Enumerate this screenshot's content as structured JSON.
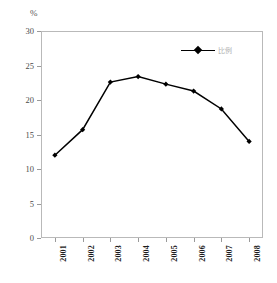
{
  "chart_data": {
    "type": "line",
    "title": "",
    "xlabel": "",
    "ylabel": "%",
    "unit_symbol": "%",
    "categories": [
      "2001",
      "2002",
      "2003",
      "2004",
      "2005",
      "2006",
      "2007",
      "2008"
    ],
    "series": [
      {
        "name": "比例",
        "values": [
          12.0,
          15.7,
          22.6,
          23.4,
          22.3,
          21.3,
          18.7,
          14.0
        ]
      }
    ],
    "ylim": [
      0,
      30
    ],
    "yticks": [
      0,
      5,
      10,
      15,
      20,
      25,
      30
    ],
    "ytick_labels": [
      "0",
      "5",
      "10",
      "15",
      "20",
      "25",
      "30"
    ],
    "grid": false,
    "legend_position": "top-right",
    "marker": "diamond",
    "line_color": "#000000",
    "marker_color": "#000000",
    "frame_color": "#b9b9b9",
    "background_color": "#ffffff"
  },
  "legend": {
    "entries": [
      {
        "label": "比例",
        "marker": "diamond-marker-icon"
      }
    ]
  },
  "axes": {
    "y_unit": "%"
  }
}
